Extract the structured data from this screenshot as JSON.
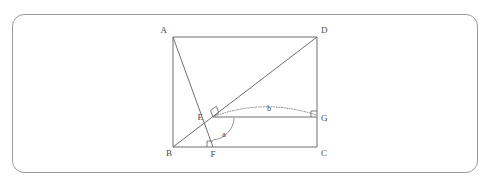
{
  "figure": {
    "frame": {
      "x": 12,
      "y": 14,
      "width": 466,
      "height": 159,
      "corner_radius": 12,
      "stroke_color": "#9a9a9a"
    },
    "stroke_color": "#6f6f6f",
    "label_color": "#4a4a4a"
  },
  "points": {
    "A": {
      "label": "A",
      "x": 173,
      "y": 37,
      "label_x": 167,
      "label_y": 33
    },
    "B": {
      "label": "B",
      "x": 173,
      "y": 147,
      "label_x": 166,
      "label_y": 156
    },
    "C": {
      "label": "C",
      "x": 317,
      "y": 147,
      "label_x": 321,
      "label_y": 156
    },
    "D": {
      "label": "D",
      "x": 317,
      "y": 37,
      "label_x": 321,
      "label_y": 33
    },
    "E": {
      "label": "E",
      "x": 213,
      "y": 117,
      "label_x": 203,
      "label_y": 120
    },
    "F": {
      "label": "F",
      "x": 213,
      "y": 147,
      "label_x": 210,
      "label_y": 157
    },
    "G": {
      "label": "G",
      "x": 317,
      "y": 117,
      "label_x": 321,
      "label_y": 121
    }
  },
  "segments": [
    {
      "name": "side-AD",
      "from": "A",
      "to": "D",
      "style": "solid"
    },
    {
      "name": "side-DC",
      "from": "D",
      "to": "C",
      "style": "solid"
    },
    {
      "name": "side-CB",
      "from": "C",
      "to": "B",
      "style": "solid"
    },
    {
      "name": "side-BA",
      "from": "B",
      "to": "A",
      "style": "solid"
    },
    {
      "name": "diagonal-BD",
      "from": "B",
      "to": "D",
      "style": "solid"
    },
    {
      "name": "line-AF",
      "from": "A",
      "to": "F",
      "style": "solid"
    },
    {
      "name": "segment-EG",
      "from": "E",
      "to": "G",
      "style": "solid"
    }
  ],
  "angle_markers": [
    {
      "name": "right-angle-at-E",
      "vertex": "E",
      "type": "square",
      "note": "AF perpendicular to BD"
    },
    {
      "name": "right-angle-at-F",
      "vertex": "F",
      "type": "square",
      "note": "EF perpendicular to BC"
    },
    {
      "name": "right-angle-at-G",
      "vertex": "G",
      "type": "square",
      "note": "EG perpendicular to DC"
    }
  ],
  "annotations": {
    "angle_a": {
      "label": "a",
      "label_x": 224,
      "label_y": 137,
      "vertex": "E",
      "style": "solid-arc",
      "note": "angle at E between EF and EG"
    },
    "angle_b": {
      "label": "b",
      "label_x": 269,
      "label_y": 111,
      "style": "dotted-arc",
      "note": "dotted arc spanning from E to G"
    }
  }
}
